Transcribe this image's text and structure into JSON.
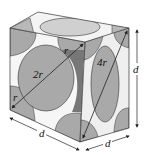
{
  "diagram": {
    "labels": {
      "face_diagonal_radius_short": "r",
      "diameter": "2r",
      "face_diagonal": "4r",
      "corner_radius_bottom": "r",
      "cube_edge_bottom_left": "d",
      "cube_edge_bottom_right": "d",
      "cube_edge_vertical": "d"
    },
    "colors": {
      "background": "#ffffff",
      "sphere_face": "#a9a9a9",
      "sphere_light": "#d2d2d2",
      "sphere_dark": "#6e6e6e",
      "outline": "#333333",
      "arrow": "#222222"
    }
  }
}
